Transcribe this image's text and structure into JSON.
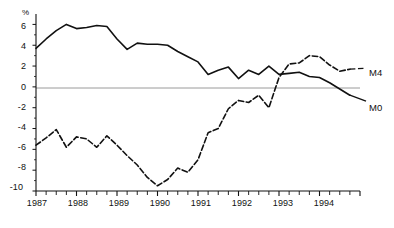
{
  "chart_data": {
    "type": "line",
    "title": "",
    "subtitle": "",
    "xlabel": "",
    "ylabel": "%",
    "unit_label": "%",
    "ylim": [
      -10,
      7
    ],
    "xlim": [
      1987.0,
      1995.0
    ],
    "grid": false,
    "zero_line": true,
    "legend_position": "right-inline",
    "y_ticks": [
      6,
      4,
      2,
      0,
      -2,
      -4,
      -6,
      -8,
      -10
    ],
    "y_tick_labels": [
      "6",
      "4",
      "2",
      "0",
      "-2",
      "-4",
      "-6",
      "-8",
      "-10"
    ],
    "x_ticks": [
      1987,
      1988,
      1989,
      1990,
      1991,
      1992,
      1993,
      1994
    ],
    "x_tick_labels": [
      "1987",
      "1988",
      "1989",
      "1990",
      "1991",
      "1992",
      "1993",
      "1994"
    ],
    "x_minor_tick_interval": 0.25,
    "series": [
      {
        "name": "M4",
        "label": "M4",
        "style": "solid",
        "color": "#111111",
        "x": [
          1987.0,
          1987.25,
          1987.5,
          1987.75,
          1988.0,
          1988.25,
          1988.5,
          1988.75,
          1989.0,
          1989.25,
          1989.5,
          1989.75,
          1990.0,
          1990.25,
          1990.5,
          1990.75,
          1991.0,
          1991.25,
          1991.5,
          1991.75,
          1992.0,
          1992.25,
          1992.5,
          1992.75,
          1993.0,
          1993.25,
          1993.5,
          1993.75,
          1994.0,
          1994.25,
          1994.5,
          1994.75
        ],
        "values": [
          3.7,
          4.6,
          5.4,
          6.0,
          5.6,
          5.7,
          5.9,
          5.8,
          4.6,
          3.6,
          4.2,
          4.1,
          4.1,
          4.0,
          3.4,
          2.9,
          2.4,
          1.2,
          1.6,
          1.9,
          0.8,
          1.6,
          1.2,
          2.0,
          1.2,
          1.3,
          1.4,
          1.0,
          0.9,
          0.4,
          -0.2,
          -0.8
        ]
      },
      {
        "name": "M0",
        "label": "M0",
        "style": "dashed",
        "color": "#111111",
        "x": [
          1987.0,
          1987.25,
          1987.5,
          1987.75,
          1988.0,
          1988.25,
          1988.5,
          1988.75,
          1989.0,
          1989.25,
          1989.5,
          1989.75,
          1990.0,
          1990.25,
          1990.5,
          1990.75,
          1991.0,
          1991.25,
          1991.5,
          1991.75,
          1992.0,
          1992.25,
          1992.5,
          1992.75,
          1993.0,
          1993.25,
          1993.5,
          1993.75,
          1994.0,
          1994.25,
          1994.5,
          1994.75
        ],
        "values": [
          -5.6,
          -4.9,
          -4.1,
          -5.8,
          -4.8,
          -5.0,
          -5.8,
          -4.7,
          -5.6,
          -6.6,
          -7.5,
          -8.7,
          -9.5,
          -8.9,
          -7.8,
          -8.2,
          -7.0,
          -4.4,
          -4.0,
          -2.1,
          -1.3,
          -1.5,
          -0.8,
          -2.0,
          0.9,
          2.2,
          2.3,
          3.0,
          2.9,
          2.1,
          1.5,
          1.7
        ]
      }
    ]
  },
  "axis": {
    "unit": "%",
    "y_labels": [
      "6",
      "4",
      "2",
      "0",
      "-2",
      "-4",
      "-6",
      "-8",
      "-10"
    ],
    "x_labels": [
      "1987",
      "1988",
      "1989",
      "1990",
      "1991",
      "1992",
      "1993",
      "1994"
    ]
  },
  "series_labels": {
    "m4": "M4",
    "m0": "M0"
  }
}
